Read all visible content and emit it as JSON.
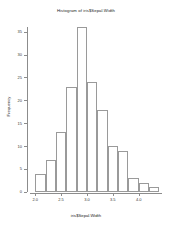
{
  "chart_data": {
    "type": "bar",
    "title": "Histogram of iris$Sepal.Width",
    "xlabel": "iris$Sepal.Width",
    "ylabel": "Frequency",
    "categories": [
      "2.0-2.2",
      "2.2-2.4",
      "2.4-2.6",
      "2.6-2.8",
      "2.8-3.0",
      "3.0-3.2",
      "3.2-3.4",
      "3.4-3.6",
      "3.6-3.8",
      "3.8-4.0",
      "4.0-4.2",
      "4.2-4.4"
    ],
    "bin_edges": [
      2.0,
      2.2,
      2.4,
      2.6,
      2.8,
      3.0,
      3.2,
      3.4,
      3.6,
      3.8,
      4.0,
      4.2,
      4.4
    ],
    "values": [
      4,
      7,
      13,
      23,
      36,
      24,
      18,
      10,
      9,
      3,
      2,
      1
    ],
    "xlim": [
      1.9,
      4.45
    ],
    "ylim": [
      0,
      36
    ],
    "xticks": [
      2.0,
      2.5,
      3.0,
      3.5,
      4.0
    ],
    "xticklabels": [
      "2.0",
      "2.5",
      "3.0",
      "3.5",
      "4.0"
    ],
    "yticks": [
      0,
      5,
      10,
      15,
      20,
      25,
      30,
      35
    ],
    "yticklabels": [
      "0",
      "5",
      "10",
      "15",
      "20",
      "25",
      "30",
      "35"
    ],
    "grid": false,
    "legend": null,
    "bar_fill": "#ffffff",
    "bar_border": "#9a9a9a",
    "axis_color": "#8c8c8c",
    "text_color": "#1a1a1a"
  }
}
